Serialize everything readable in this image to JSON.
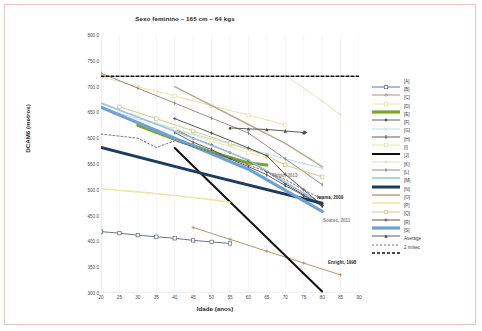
{
  "figure": {
    "title": "Sexo feminino – 165 cm – 64 kgs",
    "xlabel": "Idade (anos)",
    "ylabel": "DCAM6 (metros)"
  },
  "legend": {
    "entries": [
      {
        "label": "[A]",
        "color": "#5b6674",
        "marker": "square-open",
        "width": 0.9
      },
      {
        "label": "[B]",
        "color": "#a98a63",
        "marker": "plus",
        "width": 0.9
      },
      {
        "label": "[C]",
        "color": "#e8e2a0",
        "marker": "square-open",
        "width": 0.9
      },
      {
        "label": "[D]",
        "color": "#7ba428",
        "marker": "none",
        "width": 3.2
      },
      {
        "label": "[E]",
        "color": "#55504a",
        "marker": "diamond",
        "width": 0.9
      },
      {
        "label": "[F]",
        "color": "#bcd9ea",
        "marker": "x",
        "width": 0.9
      },
      {
        "label": "[G]",
        "color": "#4f4f4f",
        "marker": "bar",
        "width": 0.9
      },
      {
        "label": "[H]",
        "color": "#e3e59a",
        "marker": "square-open",
        "width": 0.9
      },
      {
        "label": "[I]",
        "color": "#111111",
        "marker": "none",
        "width": 2.0
      },
      {
        "label": "[J]",
        "color": "#e6d9b4",
        "marker": "plus",
        "width": 0.9
      },
      {
        "label": "[K]",
        "color": "#8c7f72",
        "marker": "bar",
        "width": 0.9
      },
      {
        "label": "[L]",
        "color": "#9ec3e6",
        "marker": "none",
        "width": 1.6
      },
      {
        "label": "[M]",
        "color": "#1f3b60",
        "marker": "none",
        "width": 3.0
      },
      {
        "label": "[N]",
        "color": "#b5ad92",
        "marker": "none",
        "width": 1.6
      },
      {
        "label": "[O]",
        "color": "#e9eaa6",
        "marker": "none",
        "width": 1.6
      },
      {
        "label": "[P]",
        "color": "#c4c98a",
        "marker": "square-open",
        "width": 0.9
      },
      {
        "label": "[Q]",
        "color": "#4a4139",
        "marker": "plus",
        "width": 0.9
      },
      {
        "label": "[R]",
        "color": "#6da3d4",
        "marker": "none",
        "width": 3.2
      },
      {
        "label": "[S]",
        "color": "#4a4a4a",
        "marker": "triangle",
        "width": 0.9
      },
      {
        "label": "Average",
        "color": "#6b6b6b",
        "marker": "none",
        "width": 0.9,
        "dash": "2,2"
      },
      {
        "label": "2 m/sec",
        "color": "#111111",
        "marker": "none",
        "width": 1.4,
        "dash": "3,2"
      }
    ]
  },
  "annotations": [
    {
      "text": "Britto, 2013",
      "x": 268,
      "y": 168,
      "style": "soft"
    },
    {
      "text": "Iwama, 2009",
      "x": 312,
      "y": 190,
      "style": "bold"
    },
    {
      "text": "Soares, 2011",
      "x": 318,
      "y": 213,
      "style": "soft"
    },
    {
      "text": "Enright, 1998",
      "x": 323,
      "y": 255,
      "style": "bold"
    }
  ],
  "chart_data": {
    "type": "line",
    "title": "Sexo feminino – 165 cm – 64 kgs",
    "xlabel": "Idade (anos)",
    "ylabel": "DCAM6 (metros)",
    "xlim": [
      20,
      90
    ],
    "ylim": [
      300,
      800
    ],
    "xticks": [
      20,
      25,
      30,
      35,
      40,
      45,
      50,
      55,
      60,
      65,
      70,
      75,
      80,
      85,
      90
    ],
    "yticks": [
      "300.0",
      "350.0",
      "400.0",
      "450.0",
      "500.0",
      "550.0",
      "600.0",
      "650.0",
      "700.0",
      "750.0",
      "800.0"
    ],
    "grid": "vertical",
    "legend_position": "right",
    "series": [
      {
        "name": "[A]",
        "color": "#5b6674",
        "marker": "square-open",
        "x": [
          20,
          25,
          30,
          35,
          40,
          45,
          50,
          55
        ],
        "y": [
          419,
          416,
          412,
          409,
          406,
          402,
          399,
          396
        ]
      },
      {
        "name": "[B]",
        "color": "#a98a63",
        "marker": "plus",
        "x": [
          45,
          55,
          65,
          75,
          85
        ],
        "y": [
          427,
          404,
          381,
          358,
          335
        ]
      },
      {
        "name": "[C]",
        "color": "#e8e2a0",
        "marker": "square-open",
        "x": [
          20,
          30,
          40,
          50,
          60,
          70
        ],
        "y": [
          719,
          700,
          682,
          663,
          645,
          626
        ]
      },
      {
        "name": "[D]",
        "color": "#7ba428",
        "marker": "none",
        "x": [
          30,
          40,
          50,
          60,
          65
        ],
        "y": [
          625,
          598,
          573,
          552,
          548
        ]
      },
      {
        "name": "[E]",
        "color": "#55504a",
        "marker": "diamond",
        "x": [
          40,
          45,
          50,
          55,
          60,
          65,
          70,
          75,
          80
        ],
        "y": [
          618,
          600,
          587,
          572,
          557,
          535,
          512,
          490,
          470
        ]
      },
      {
        "name": "[F]",
        "color": "#bcd9ea",
        "marker": "x",
        "x": [
          25,
          35,
          45,
          55,
          65,
          70,
          75,
          80
        ],
        "y": [
          648,
          628,
          608,
          589,
          570,
          560,
          551,
          542
        ]
      },
      {
        "name": "[G]",
        "color": "#4f4f4f",
        "marker": "bar",
        "x": [
          40,
          45,
          50,
          55,
          60,
          65,
          70,
          75,
          80
        ],
        "y": [
          611,
          592,
          578,
          560,
          545,
          529,
          508,
          489,
          468
        ]
      },
      {
        "name": "[H]",
        "color": "#e3e59a",
        "marker": "square-open",
        "x": [
          30,
          40,
          50,
          60,
          70
        ],
        "y": [
          640,
          618,
          595,
          572,
          549
        ]
      },
      {
        "name": "[I]",
        "color": "#111111",
        "marker": "none",
        "x": [
          40,
          80
        ],
        "y": [
          581,
          303
        ]
      },
      {
        "name": "[J]",
        "color": "#e6d9b4",
        "marker": "plus",
        "x": [
          70,
          80,
          85
        ],
        "y": [
          722,
          672,
          645
        ]
      },
      {
        "name": "[K]",
        "color": "#8c7f72",
        "marker": "bar",
        "x": [
          20,
          30,
          40,
          50,
          60,
          70,
          80
        ],
        "y": [
          726,
          697,
          668,
          639,
          610,
          560,
          510
        ]
      },
      {
        "name": "[L]",
        "color": "#9ec3e6",
        "marker": "none",
        "x": [
          20,
          45,
          60,
          80
        ],
        "y": [
          668,
          600,
          558,
          472
        ]
      },
      {
        "name": "[M]",
        "color": "#1f3b60",
        "marker": "none",
        "x": [
          20,
          50,
          80
        ],
        "y": [
          582,
          527,
          474
        ]
      },
      {
        "name": "[N]",
        "color": "#b5ad92",
        "marker": "none",
        "x": [
          40,
          55,
          70,
          80
        ],
        "y": [
          700,
          645,
          590,
          545
        ]
      },
      {
        "name": "[O]",
        "color": "#e9eaa6",
        "marker": "none",
        "x": [
          20,
          30,
          40,
          50,
          55
        ],
        "y": [
          502,
          496,
          489,
          481,
          476
        ]
      },
      {
        "name": "[P]",
        "color": "#c4c98a",
        "marker": "square-open",
        "x": [
          25,
          35,
          45,
          55,
          65,
          70,
          80
        ],
        "y": [
          661,
          638,
          614,
          590,
          566,
          548,
          525
        ]
      },
      {
        "name": "[Q]",
        "color": "#4a4139",
        "marker": "plus",
        "x": [
          40,
          50,
          60,
          65,
          70,
          75,
          80
        ],
        "y": [
          638,
          610,
          581,
          566,
          530,
          500,
          470
        ]
      },
      {
        "name": "[R]",
        "color": "#6da3d4",
        "marker": "none",
        "x": [
          20,
          40,
          60,
          80
        ],
        "y": [
          660,
          600,
          540,
          458
        ]
      },
      {
        "name": "[S]",
        "color": "#4a4a4a",
        "marker": "triangle",
        "x": [
          55,
          60,
          65,
          70,
          75
        ],
        "y": [
          620,
          618,
          617,
          614,
          611
        ]
      },
      {
        "name": "Average",
        "color": "#6b6b6b",
        "marker": "none",
        "dash": "2,2",
        "x": [
          20,
          30,
          35,
          40,
          50,
          55,
          60,
          65,
          70,
          75,
          80
        ],
        "y": [
          608,
          600,
          582,
          595,
          572,
          562,
          548,
          535,
          520,
          500,
          482
        ]
      },
      {
        "name": "2 m/sec",
        "color": "#111111",
        "marker": "none",
        "dash": "3,2",
        "x": [
          20,
          90
        ],
        "y": [
          720,
          720
        ]
      }
    ]
  }
}
